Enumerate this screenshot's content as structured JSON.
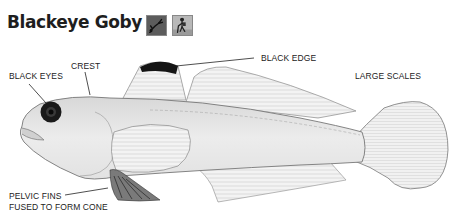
{
  "header": {
    "title": "Blackeye Goby",
    "icons": [
      {
        "name": "diver-icon",
        "bg": "#5a5a5a"
      },
      {
        "name": "tidepool-walker-icon",
        "bg": "#b5b5b5"
      }
    ]
  },
  "illustration": {
    "subject": "Blackeye Goby",
    "labels": {
      "black_eyes": "BLACK EYES",
      "crest": "CREST",
      "black_edge": "BLACK EDGE",
      "large_scales": "LARGE SCALES",
      "pelvic_line1": "PELVIC FINS",
      "pelvic_line2": "FUSED TO FORM CONE"
    }
  }
}
